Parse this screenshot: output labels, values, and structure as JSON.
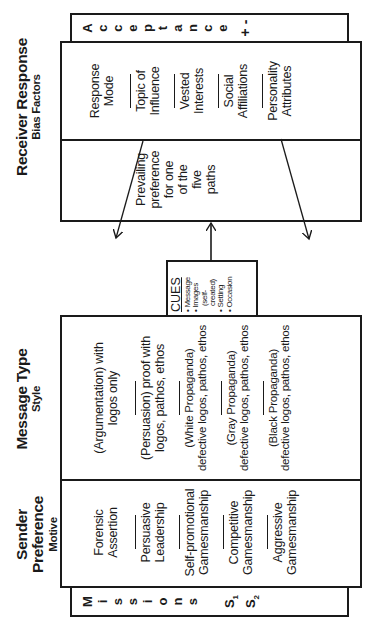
{
  "diagram": {
    "orientation": "rotated 90 degrees counter-clockwise",
    "receiver": {
      "title": "Receiver Response",
      "subtitle": "Bias Factors",
      "left_column": [
        "Prevailing",
        "preference",
        "for one",
        "of the",
        "five",
        "paths"
      ],
      "factors": [
        {
          "line1": "Response",
          "line2": "Mode"
        },
        {
          "line1": "Topic of",
          "line2": "Influence"
        },
        {
          "line1": "Vested",
          "line2": "Interests"
        },
        {
          "line1": "Social",
          "line2": "Affiliations"
        },
        {
          "line1": "Personality",
          "line2": "Attributes"
        }
      ]
    },
    "acceptance_bar": {
      "letters": [
        "A",
        "c",
        "c",
        "e",
        "p",
        "t",
        "a",
        "n",
        "c",
        "e"
      ],
      "signs": "+ -"
    },
    "cues": {
      "title": "CUES",
      "items": [
        "• Message",
        "• Images",
        "(self-",
        "created)",
        "• Setting",
        "• Occasion"
      ]
    },
    "message": {
      "title": "Message Type",
      "subtitle": "Style",
      "types": [
        {
          "line1": "(Argumentation) with",
          "line2": "logos only"
        },
        {
          "line1": "(Persuasion) proof with",
          "line2": "logos, pathos, ethos"
        },
        {
          "line1": "(White Propaganda)",
          "line2": "defective logos, pathos, ethos"
        },
        {
          "line1": "(Gray Propaganda)",
          "line2": "defective logos, pathos, ethos"
        },
        {
          "line1": "(Black Propaganda)",
          "line2": "defective logos, pathos, ethos"
        }
      ]
    },
    "sender": {
      "title": "Sender Preference",
      "subtitle": "Motive",
      "motives": [
        {
          "line1": "Forensic",
          "line2": "Assertion"
        },
        {
          "line1": "Persuasive",
          "line2": "Leadership"
        },
        {
          "line1": "Self-promotional",
          "line2": "Gamesmanship"
        },
        {
          "line1": "Competitive",
          "line2": "Gamesmanship"
        },
        {
          "line1": "Aggressive",
          "line2": "Gamesmanship"
        }
      ]
    },
    "missions_bar": {
      "letters": [
        "M",
        "i",
        "s",
        "s",
        "i",
        "o",
        "n",
        "s"
      ],
      "s1": "S",
      "s1_sub": "1",
      "s2": "S",
      "s2_sub": "2"
    },
    "colors": {
      "ink": "#1a1a1a",
      "background": "#ffffff"
    }
  }
}
